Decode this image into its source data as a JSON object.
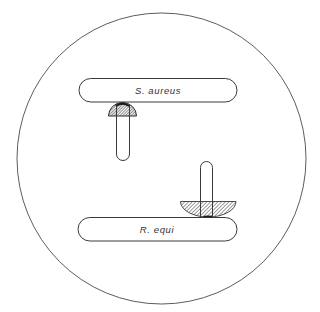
{
  "diagram": {
    "type": "culture-plate-diagram",
    "colors": {
      "line": "#3a3a3a",
      "hatch": "#3a3a3a",
      "background": "#ffffff"
    },
    "plate": {
      "shape": "circle"
    },
    "reference_streaks": [
      {
        "id": "top",
        "label": "S. aureus"
      },
      {
        "id": "bottom",
        "label": "R. equi"
      }
    ],
    "test_streaks": [
      {
        "id": "test-1",
        "orientation": "vertical",
        "adjacent_to": "S. aureus",
        "zone": "small semicircular hatched zone"
      },
      {
        "id": "test-2",
        "orientation": "vertical",
        "adjacent_to": "R. equi",
        "zone": "large inverted semicircular hatched zone"
      }
    ]
  }
}
